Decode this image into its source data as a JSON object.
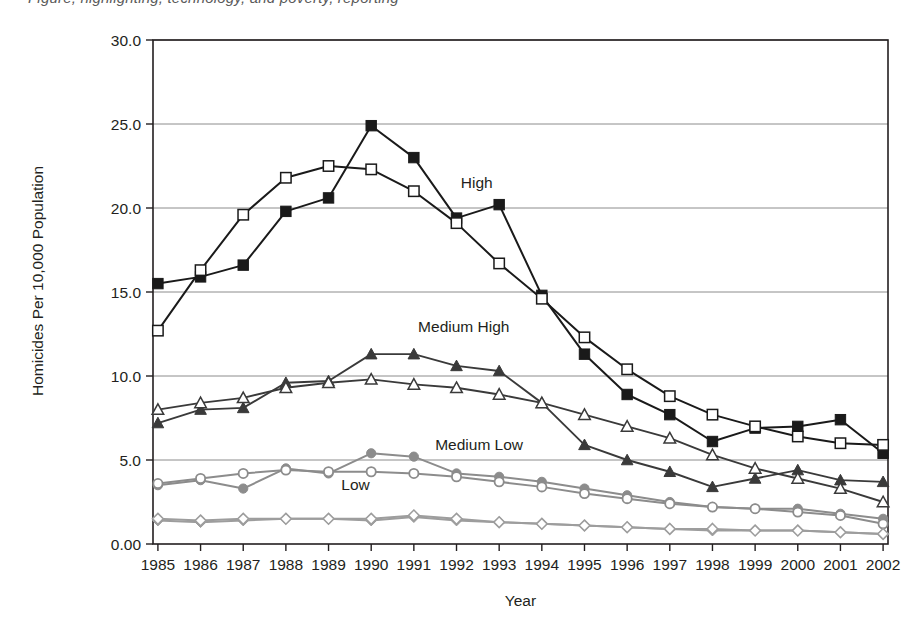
{
  "figure": {
    "clipped_caption_above": "Figure, highlighting, technology, and poverty, reporting",
    "axis_color": "#231f20",
    "grid_color": "#8c8c8c"
  },
  "chart_data": {
    "type": "line",
    "title": "",
    "xlabel": "Year",
    "ylabel": "Homicides Per 10,000 Population",
    "grid": true,
    "legend_position": "inline-annotations",
    "xlim": [
      1985,
      2002
    ],
    "ylim": [
      0,
      30
    ],
    "ytick_labels": [
      "0.00",
      "5.0",
      "10.0",
      "15.0",
      "20.0",
      "25.0",
      "30.0"
    ],
    "ytick_values": [
      0,
      5,
      10,
      15,
      20,
      25,
      30
    ],
    "categories": [
      1985,
      1986,
      1987,
      1988,
      1989,
      1990,
      1991,
      1992,
      1993,
      1994,
      1995,
      1996,
      1997,
      1998,
      1999,
      2000,
      2001,
      2002
    ],
    "xtick_labels": [
      "1985",
      "1986",
      "1987",
      "1988",
      "1989",
      "1990",
      "1991",
      "1992",
      "1993",
      "1994",
      "1995",
      "1996",
      "1997",
      "1998",
      "1999",
      "2000",
      "2001",
      "2002"
    ],
    "series": [
      {
        "name": "High (filled square)",
        "group": "High",
        "marker": "filled-square",
        "color": "#1a1a1a",
        "values": [
          15.5,
          15.9,
          16.6,
          19.8,
          20.6,
          24.9,
          23.0,
          19.4,
          20.2,
          14.8,
          11.3,
          8.9,
          7.7,
          6.1,
          6.9,
          7.0,
          7.4,
          5.4
        ]
      },
      {
        "name": "High (open square)",
        "group": "High",
        "marker": "open-square",
        "color": "#1a1a1a",
        "values": [
          12.7,
          16.3,
          19.6,
          21.8,
          22.5,
          22.3,
          21.0,
          19.1,
          16.7,
          14.6,
          12.3,
          10.4,
          8.8,
          7.7,
          7.0,
          6.4,
          6.0,
          5.9
        ]
      },
      {
        "name": "Medium High (filled triangle)",
        "group": "Medium High",
        "marker": "filled-triangle",
        "color": "#3a3a3a",
        "values": [
          7.2,
          8.0,
          8.1,
          9.6,
          9.7,
          11.3,
          11.3,
          10.6,
          10.3,
          8.4,
          5.9,
          5.0,
          4.3,
          3.4,
          3.9,
          4.4,
          3.8,
          3.7
        ]
      },
      {
        "name": "Medium High (open triangle)",
        "group": "Medium High",
        "marker": "open-triangle",
        "color": "#3a3a3a",
        "values": [
          8.0,
          8.4,
          8.7,
          9.3,
          9.6,
          9.8,
          9.5,
          9.3,
          8.9,
          8.4,
          7.7,
          7.0,
          6.3,
          5.3,
          4.5,
          3.9,
          3.3,
          2.5
        ]
      },
      {
        "name": "Medium Low (filled circle)",
        "group": "Medium Low",
        "marker": "filled-circle",
        "color": "#8c8c8c",
        "values": [
          3.5,
          3.8,
          3.3,
          4.5,
          4.2,
          5.4,
          5.2,
          4.2,
          4.0,
          3.7,
          3.3,
          2.9,
          2.5,
          2.2,
          2.1,
          2.1,
          1.8,
          1.5
        ]
      },
      {
        "name": "Medium Low (open circle)",
        "group": "Medium Low",
        "marker": "open-circle",
        "color": "#8c8c8c",
        "values": [
          3.6,
          3.9,
          4.2,
          4.4,
          4.3,
          4.3,
          4.2,
          4.0,
          3.7,
          3.4,
          3.0,
          2.7,
          2.4,
          2.2,
          2.1,
          1.9,
          1.7,
          1.2
        ]
      },
      {
        "name": "Low (filled diamond)",
        "group": "Low",
        "marker": "filled-diamond",
        "color": "#9d9d9d",
        "values": [
          1.4,
          1.3,
          1.4,
          1.5,
          1.5,
          1.4,
          1.6,
          1.4,
          1.3,
          1.2,
          1.1,
          1.0,
          0.9,
          0.8,
          0.8,
          0.8,
          0.7,
          0.6
        ]
      },
      {
        "name": "Low (open diamond)",
        "group": "Low",
        "marker": "open-diamond",
        "color": "#9d9d9d",
        "values": [
          1.5,
          1.4,
          1.5,
          1.5,
          1.5,
          1.5,
          1.7,
          1.5,
          1.3,
          1.2,
          1.1,
          1.0,
          0.9,
          0.9,
          0.8,
          0.8,
          0.7,
          0.6
        ]
      }
    ],
    "annotations": [
      {
        "text": "High",
        "x": 1992.1,
        "y": 21.2
      },
      {
        "text": "Medium High",
        "x": 1991.1,
        "y": 12.6
      },
      {
        "text": "Medium Low",
        "x": 1991.5,
        "y": 5.6
      },
      {
        "text": "Low",
        "x": 1989.3,
        "y": 3.2
      }
    ]
  }
}
